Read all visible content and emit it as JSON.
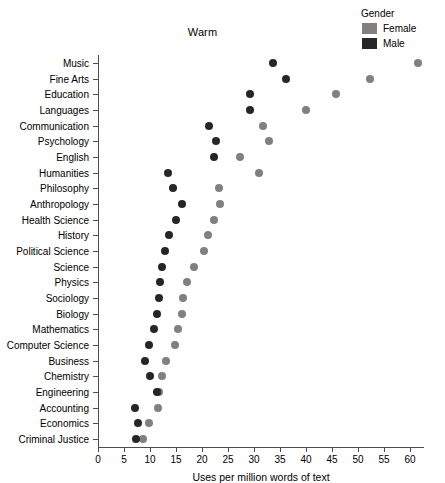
{
  "chart_data": {
    "type": "scatter",
    "title": "Warm",
    "xlabel": "Uses per million words of text",
    "ylabel": "",
    "xlim": [
      0,
      62.5
    ],
    "xticks": [
      0,
      5,
      10,
      15,
      20,
      25,
      30,
      35,
      40,
      45,
      50,
      55,
      60
    ],
    "grid": false,
    "legend": {
      "title": "Gender",
      "position": "top-right",
      "entries": [
        {
          "name": "Female",
          "color": "#808080"
        },
        {
          "name": "Male",
          "color": "#262626"
        }
      ]
    },
    "categories": [
      "Music",
      "Fine Arts",
      "Education",
      "Languages",
      "Communication",
      "Psychology",
      "English",
      "Humanities",
      "Philosophy",
      "Anthropology",
      "Health Science",
      "History",
      "Political Science",
      "Science",
      "Physics",
      "Sociology",
      "Biology",
      "Mathematics",
      "Computer Science",
      "Business",
      "Chemistry",
      "Engineering",
      "Accounting",
      "Economics",
      "Criminal Justice"
    ],
    "series": [
      {
        "name": "Female",
        "color": "#808080",
        "values": [
          61.5,
          52.4,
          45.8,
          40.0,
          31.7,
          32.8,
          27.4,
          30.9,
          23.2,
          23.5,
          22.4,
          21.2,
          20.4,
          18.4,
          17.2,
          16.4,
          16.1,
          15.3,
          14.8,
          13.1,
          12.3,
          11.8,
          11.5,
          9.9,
          8.6
        ]
      },
      {
        "name": "Male",
        "color": "#262626",
        "values": [
          33.7,
          36.1,
          29.3,
          29.3,
          21.3,
          22.6,
          22.4,
          13.5,
          14.5,
          16.2,
          15.0,
          13.6,
          12.8,
          12.4,
          12.0,
          11.8,
          11.4,
          10.8,
          9.8,
          9.0,
          10.0,
          11.4,
          7.1,
          7.7,
          7.4
        ]
      }
    ]
  }
}
